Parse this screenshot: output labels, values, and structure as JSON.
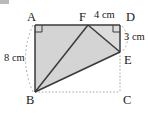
{
  "figure": {
    "kind": "geometry-diagram",
    "colors": {
      "shade_fill": "#d4d4d4",
      "shade_fill_light": "#dcdcdc",
      "stroke": "#3a3a3a",
      "dotted_stroke": "#a8a8a8",
      "label_color": "#1a1a1a",
      "background": "#ffffff",
      "artifact": "#b9b9b9"
    },
    "vertices": [
      {
        "id": "A",
        "label": "A",
        "x": 35,
        "y": 25,
        "label_x": 27,
        "label_y": 11
      },
      {
        "id": "F",
        "label": "F",
        "x": 88,
        "y": 25,
        "label_x": 79,
        "label_y": 11
      },
      {
        "id": "D",
        "label": "D",
        "x": 120,
        "y": 25,
        "label_x": 126,
        "label_y": 11
      },
      {
        "id": "E",
        "label": "E",
        "x": 120,
        "y": 52,
        "label_x": 124,
        "label_y": 54
      },
      {
        "id": "C",
        "label": "C",
        "x": 120,
        "y": 92,
        "label_x": 123,
        "label_y": 94
      },
      {
        "id": "B",
        "label": "B",
        "x": 35,
        "y": 92,
        "label_x": 26,
        "label_y": 94
      }
    ],
    "dimensions": [
      {
        "id": "side-AB",
        "label": "8 cm",
        "x": 4,
        "y": 53
      },
      {
        "id": "side-FD",
        "label": "4 cm",
        "x": 94,
        "y": 10
      },
      {
        "id": "side-DE",
        "label": "3 cm",
        "x": 124,
        "y": 32
      }
    ],
    "solid_edges": [
      {
        "id": "edge-AF",
        "from": "A",
        "to": "F"
      },
      {
        "id": "edge-FD",
        "from": "F",
        "to": "D"
      },
      {
        "id": "edge-DE",
        "from": "D",
        "to": "E"
      },
      {
        "id": "edge-FE",
        "from": "F",
        "to": "E"
      },
      {
        "id": "edge-FB",
        "from": "F",
        "to": "B"
      },
      {
        "id": "edge-BE",
        "from": "B",
        "to": "E"
      },
      {
        "id": "edge-AB",
        "from": "A",
        "to": "B"
      }
    ],
    "dotted_edges": [
      {
        "id": "edge-BC",
        "from": "B",
        "to": "C"
      },
      {
        "id": "edge-EC",
        "from": "E",
        "to": "C"
      }
    ],
    "shaded_regions": [
      {
        "id": "region-ABEF",
        "points": "A,B,E,F",
        "fill": "#d4d4d4"
      },
      {
        "id": "region-FDE",
        "points": "F,D,E",
        "fill": "#dcdcdc"
      }
    ],
    "right_angle_marks": [
      {
        "id": "right-angle-A",
        "at": "A"
      },
      {
        "id": "right-angle-D",
        "at": "D"
      }
    ],
    "dashed_arcs": [
      {
        "id": "arc-AB-extent",
        "from": "A",
        "to": "B",
        "side": "left"
      },
      {
        "id": "arc-DE-extent",
        "from": "D",
        "to": "E",
        "side": "right"
      }
    ]
  }
}
